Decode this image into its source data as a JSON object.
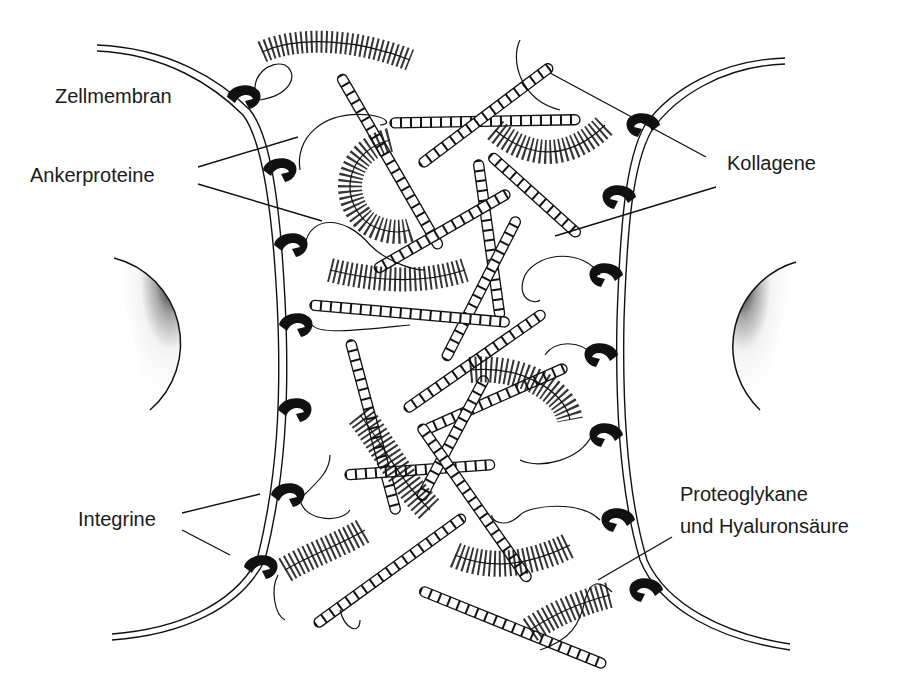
{
  "diagram": {
    "title": "",
    "labels": {
      "zellmembran": "Zellmembran",
      "ankerproteine": "Ankerproteine",
      "kollagene": "Kollagene",
      "integrine": "Integrine",
      "proteoglykane_line1": "Proteoglykane",
      "proteoglykane_line2": "und Hyaluronsäure"
    },
    "colors": {
      "ink": "#111111",
      "background": "#ffffff"
    }
  }
}
